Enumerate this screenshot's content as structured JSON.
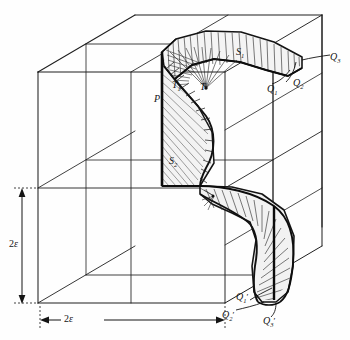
{
  "figure": {
    "kind": "geometric-diagram",
    "background_color": "#fefefe",
    "line_color": "#1a1a1a",
    "hatch_color": "#2b2b2b",
    "fill_color": "#f2f2f2"
  },
  "labels": {
    "point_p": "P",
    "point_t": "T",
    "point_t1_base": "T",
    "point_t1_sub": "1",
    "surface_s1_base": "S",
    "surface_s1_sub": "1",
    "surface_s2_base": "S",
    "surface_s2_sub": "2",
    "q1_base": "Q",
    "q1_sub": "1",
    "q2_base": "Q",
    "q2_sub": "2",
    "q3_base": "Q",
    "q3_sub": "3",
    "q1p_base": "Q",
    "q1p_sub": "1",
    "q1p_prime": "′",
    "q2p_base": "Q",
    "q2p_sub": "2",
    "q2p_prime": "′",
    "q3p_base": "Q",
    "q3p_sub": "3",
    "q3p_prime": "′"
  },
  "dimensions": {
    "vertical_value": "2",
    "vertical_symbol": "ε",
    "horizontal_value": "2",
    "horizontal_symbol": "ε"
  }
}
